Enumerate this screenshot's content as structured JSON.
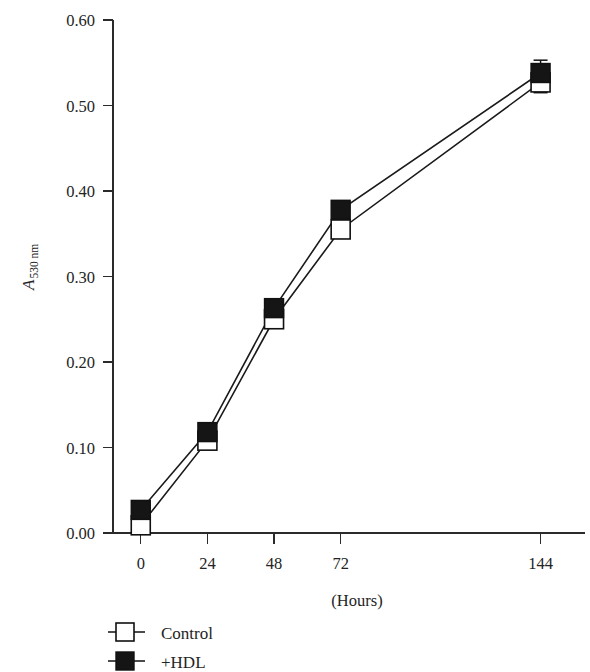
{
  "chart_data": {
    "type": "line",
    "title": "",
    "subtitle": "",
    "xlabel": "(Hours)",
    "ylabel": "A",
    "ylabel_subscript": "530 nm",
    "x": [
      0,
      24,
      48,
      72,
      144
    ],
    "xtick_labels": [
      "0",
      "24",
      "48",
      "72",
      "144"
    ],
    "ytick_labels": [
      "0.00",
      "0.10",
      "0.20",
      "0.30",
      "0.40",
      "0.50",
      "0.60"
    ],
    "ytick_values": [
      0.0,
      0.1,
      0.2,
      0.3,
      0.4,
      0.5,
      0.6
    ],
    "xlim": [
      -10,
      160
    ],
    "ylim": [
      0.0,
      0.6
    ],
    "grid": false,
    "legend_position": "below-axis-left",
    "series": [
      {
        "name": "Control",
        "marker": "open-square",
        "color": "#ffffff",
        "edge_color": "#111111",
        "values": [
          0.009,
          0.108,
          0.25,
          0.355,
          0.527
        ],
        "errors": [
          0.0,
          0.0,
          0.0,
          0.0,
          0.012
        ]
      },
      {
        "name": "+HDL",
        "marker": "filled-square",
        "color": "#151515",
        "edge_color": "#111111",
        "values": [
          0.027,
          0.118,
          0.263,
          0.378,
          0.538
        ],
        "errors": [
          0.0,
          0.0,
          0.0,
          0.0,
          0.015
        ]
      }
    ]
  },
  "legend": {
    "items": [
      {
        "label": "Control",
        "marker": "open-square"
      },
      {
        "label": "+HDL",
        "marker": "filled-square"
      }
    ]
  },
  "axes": {
    "y_axis_name": "absorbance-530nm",
    "x_axis_name": "time-hours"
  }
}
